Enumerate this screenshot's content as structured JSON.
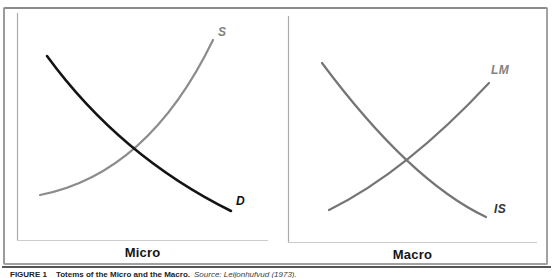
{
  "figure": {
    "caption": {
      "figure_label": "FIGURE 1",
      "title": "Totems of the Micro and the Macro.",
      "source": "Source: Leijonhufvud (1973)."
    },
    "panels": [
      {
        "title": "Micro",
        "curves": [
          {
            "id": "supply",
            "label": "S"
          },
          {
            "id": "demand",
            "label": "D"
          }
        ]
      },
      {
        "title": "Macro",
        "curves": [
          {
            "id": "lm",
            "label": "LM"
          },
          {
            "id": "is",
            "label": "IS"
          }
        ]
      }
    ],
    "colors": {
      "demand_curve": "#141414",
      "supply_curve": "#8c8c8c",
      "is_curve": "#757575",
      "lm_curve": "#757575",
      "axis_vertical": "#aaaaaa",
      "axis_bottom": "#cccccc",
      "frame_border": "#9a9a9a",
      "caption_rule": "#555555"
    }
  }
}
